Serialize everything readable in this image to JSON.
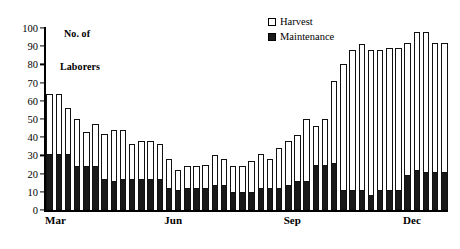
{
  "axis_title": {
    "line1": "No. of",
    "line2": "Laborers"
  },
  "legend": {
    "position": "top-center-right",
    "items": [
      {
        "label": "Harvest",
        "swatch": "hollow-square-icon",
        "color": "#ffffff"
      },
      {
        "label": "Maintenance",
        "swatch": "filled-square-icon",
        "color": "#191919"
      }
    ]
  },
  "chart_data": {
    "type": "bar",
    "stacked": true,
    "title": "",
    "subtitle": "",
    "xlabel": "",
    "ylabel": "No. of Laborers",
    "ylim": [
      0,
      100
    ],
    "yticks": [
      0,
      10,
      20,
      30,
      40,
      50,
      60,
      70,
      80,
      90,
      100
    ],
    "ytick_labels": [
      "0",
      "10",
      "20",
      "30",
      "40",
      "50",
      "60",
      "70",
      "80",
      "90",
      "100"
    ],
    "grid": false,
    "legend_position": "upper right",
    "x_tick_labels": [
      "Mar",
      "Jun",
      "Sep",
      "Dec"
    ],
    "x_tick_indices": [
      0,
      13,
      26,
      39
    ],
    "categories": [
      "1",
      "2",
      "3",
      "4",
      "5",
      "6",
      "7",
      "8",
      "9",
      "10",
      "11",
      "12",
      "13",
      "14",
      "15",
      "16",
      "17",
      "18",
      "19",
      "20",
      "21",
      "22",
      "23",
      "24",
      "25",
      "26",
      "27",
      "28",
      "29",
      "30",
      "31",
      "32",
      "33",
      "34",
      "35",
      "36",
      "37",
      "38",
      "39",
      "40",
      "41",
      "42",
      "43",
      "44"
    ],
    "series": [
      {
        "name": "Maintenance",
        "color": "#191919",
        "values": [
          31,
          31,
          31,
          24,
          24,
          24,
          17,
          16,
          17,
          17,
          17,
          17,
          17,
          12,
          11,
          12,
          12,
          12,
          14,
          14,
          10,
          10,
          10,
          12,
          12,
          12,
          14,
          16,
          16,
          25,
          25,
          26,
          11,
          11,
          11,
          8,
          11,
          11,
          11,
          19,
          22,
          21,
          21,
          21
        ]
      },
      {
        "name": "Harvest",
        "color": "#ffffff",
        "values": [
          33,
          33,
          25,
          26,
          19,
          23,
          25,
          28,
          27,
          19,
          21,
          21,
          19,
          16,
          11,
          12,
          12,
          13,
          16,
          14,
          14,
          14,
          17,
          19,
          16,
          22,
          24,
          25,
          34,
          21,
          25,
          45,
          69,
          77,
          80,
          80,
          77,
          78,
          78,
          73,
          76,
          77,
          71,
          71
        ]
      }
    ],
    "totals": [
      64,
      64,
      56,
      50,
      43,
      47,
      42,
      44,
      44,
      36,
      38,
      38,
      36,
      28,
      22,
      24,
      24,
      25,
      30,
      28,
      24,
      24,
      27,
      31,
      28,
      34,
      38,
      41,
      50,
      46,
      50,
      71,
      80,
      88,
      91,
      88,
      88,
      89,
      89,
      92,
      98,
      98,
      92,
      92
    ]
  }
}
